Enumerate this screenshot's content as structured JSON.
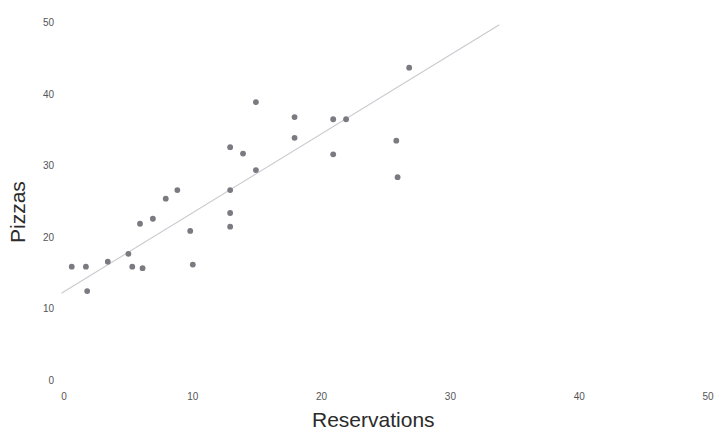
{
  "chart_data": {
    "type": "scatter",
    "title": "",
    "xlabel": "Reservations",
    "ylabel": "Pizzas",
    "xlim": [
      0,
      50
    ],
    "ylim": [
      0,
      50
    ],
    "xticks": [
      0,
      10,
      20,
      30,
      40,
      50
    ],
    "yticks": [
      0,
      10,
      20,
      30,
      40,
      50
    ],
    "xtick_labels": [
      "0",
      "10",
      "20",
      "30",
      "40",
      "50"
    ],
    "ytick_labels": [
      "0",
      "10",
      "20",
      "30",
      "40",
      "50"
    ],
    "grid": false,
    "legend": false,
    "marker_color": "#7a7a80",
    "line_color": "#c9c9cf",
    "axis_label_color": "#2b2b2b",
    "tick_label_color": "#555555",
    "background": "#ffffff",
    "series": [
      {
        "name": "Pizzas vs Reservations",
        "marker": "circle",
        "points": [
          {
            "x": 0.6,
            "y": 16.1
          },
          {
            "x": 1.7,
            "y": 16.1
          },
          {
            "x": 1.8,
            "y": 12.7
          },
          {
            "x": 3.4,
            "y": 16.8
          },
          {
            "x": 5.0,
            "y": 17.9
          },
          {
            "x": 5.3,
            "y": 16.1
          },
          {
            "x": 6.1,
            "y": 15.9
          },
          {
            "x": 5.9,
            "y": 22.1
          },
          {
            "x": 6.9,
            "y": 22.8
          },
          {
            "x": 7.9,
            "y": 25.6
          },
          {
            "x": 8.8,
            "y": 26.8
          },
          {
            "x": 9.8,
            "y": 21.1
          },
          {
            "x": 10.0,
            "y": 16.4
          },
          {
            "x": 12.9,
            "y": 32.8
          },
          {
            "x": 12.9,
            "y": 26.8
          },
          {
            "x": 12.9,
            "y": 23.6
          },
          {
            "x": 12.9,
            "y": 21.7
          },
          {
            "x": 13.9,
            "y": 31.9
          },
          {
            "x": 14.9,
            "y": 29.6
          },
          {
            "x": 14.9,
            "y": 39.1
          },
          {
            "x": 17.9,
            "y": 37.0
          },
          {
            "x": 17.9,
            "y": 34.1
          },
          {
            "x": 20.9,
            "y": 36.7
          },
          {
            "x": 20.9,
            "y": 31.8
          },
          {
            "x": 21.9,
            "y": 36.7
          },
          {
            "x": 25.8,
            "y": 33.7
          },
          {
            "x": 25.9,
            "y": 28.6
          },
          {
            "x": 26.8,
            "y": 43.9
          }
        ]
      }
    ],
    "trendline": {
      "name": "linear-fit",
      "x_start": -0.2,
      "y_start": 12.4,
      "x_end": 33.8,
      "y_end": 49.9
    }
  }
}
